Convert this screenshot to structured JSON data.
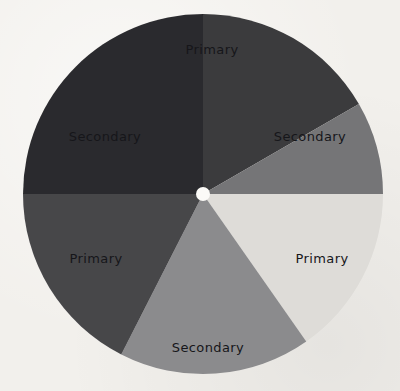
{
  "background": {
    "color": "#f2f0ec",
    "name": "paper-background"
  },
  "chart_data": {
    "type": "pie",
    "title": "",
    "subtitle": "",
    "xlabel": "",
    "ylabel": "",
    "legend": "none",
    "grid": false,
    "center": {
      "x": 203,
      "y": 194
    },
    "radius": 180,
    "hub": {
      "radius": 7,
      "color": "#fbfaf7"
    },
    "categories": [
      "Primary",
      "Secondary",
      "Primary",
      "Secondary",
      "Primary",
      "Secondary"
    ],
    "values": [
      60,
      60,
      60,
      60,
      60,
      60
    ],
    "segments": [
      {
        "label": "Primary",
        "color": "#3a3a3c",
        "start_angle": -90,
        "end_angle": -30,
        "label_angle": -60,
        "label_radius": 138,
        "label_x": 212,
        "label_y": 50,
        "label_rotation": 0,
        "position": "top"
      },
      {
        "label": "Secondary",
        "color": "#757577",
        "start_angle": -30,
        "end_angle": 0,
        "label_angle": -18,
        "label_radius": 125,
        "label_x": 310,
        "label_y": 137,
        "label_rotation": 0,
        "position": "right-upper"
      },
      {
        "label": "Primary",
        "color": "#dedcd8",
        "start_angle": 0,
        "end_angle": 55,
        "label_angle": 26,
        "label_radius": 124,
        "label_x": 322,
        "label_y": 259,
        "label_rotation": 0,
        "position": "right-lower"
      },
      {
        "label": "Secondary",
        "color": "#8b8b8d",
        "start_angle": 55,
        "end_angle": 117,
        "label_angle": 86,
        "label_radius": 141,
        "label_x": 208,
        "label_y": 348,
        "label_rotation": 0,
        "position": "bottom"
      },
      {
        "label": "Primary",
        "color": "#47474a",
        "start_angle": 117,
        "end_angle": 180,
        "label_angle": 148,
        "label_radius": 125,
        "label_x": 96,
        "label_y": 259,
        "label_rotation": 0,
        "position": "left-lower"
      },
      {
        "label": "Secondary",
        "color": "#2c2c2f",
        "start_angle": 180,
        "end_angle": 270,
        "label_angle": 222,
        "label_radius": 129,
        "label_x": 105,
        "label_y": 137,
        "label_rotation": 0,
        "position": "left-upper"
      }
    ]
  }
}
